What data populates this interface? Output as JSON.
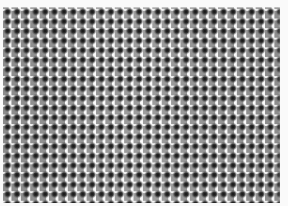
{
  "image": {
    "subject": "woven mesh fabric texture",
    "style": "grayscale",
    "colors": {
      "background": "#fafafa",
      "thread_dark": "#1e1e1e",
      "thread_mid": "#8a8a8a",
      "gap_light": "#f0f0f0"
    },
    "pattern": {
      "period_x_px": 9.4,
      "period_y_px": 9.6
    }
  }
}
